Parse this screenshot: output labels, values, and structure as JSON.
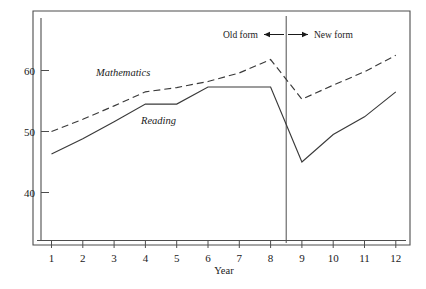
{
  "chart_data": {
    "type": "line",
    "title": "",
    "subtitle": "",
    "xlabel": "Year",
    "ylabel": "",
    "x": [
      1,
      2,
      3,
      4,
      5,
      6,
      7,
      8,
      9,
      10,
      11,
      12
    ],
    "xtick_labels": [
      "1",
      "2",
      "3",
      "4",
      "5",
      "6",
      "7",
      "8",
      "9",
      "10",
      "11",
      "12"
    ],
    "ytick_labels": [
      "40",
      "50",
      "60"
    ],
    "ytick_values": [
      40,
      50,
      60
    ],
    "xlim": [
      0.55,
      12.6
    ],
    "ylim": [
      33.5,
      65.5
    ],
    "grid": false,
    "legend_position": "inline-labels",
    "series": [
      {
        "name": "Mathematics",
        "style": "dashed",
        "label_text": "Mathematics",
        "values": [
          50.0,
          52.0,
          54.2,
          56.5,
          57.2,
          58.2,
          59.6,
          61.8,
          55.3,
          57.6,
          59.8,
          62.5
        ]
      },
      {
        "name": "Reading",
        "style": "solid",
        "label_text": "Reading",
        "values": [
          46.3,
          48.8,
          51.6,
          54.5,
          54.5,
          57.3,
          57.3,
          57.3,
          45.0,
          49.5,
          52.4,
          56.5
        ]
      }
    ],
    "annotations": [
      {
        "id": "divider",
        "type": "vertical-line",
        "x": 8.5,
        "note": "form change boundary"
      },
      {
        "id": "old-form",
        "type": "text-arrow",
        "text": "Old form",
        "direction": "left"
      },
      {
        "id": "new-form",
        "type": "text-arrow",
        "text": "New form",
        "direction": "right"
      }
    ]
  },
  "axes": {
    "x_title": "Year",
    "x_ticks": [
      "1",
      "2",
      "3",
      "4",
      "5",
      "6",
      "7",
      "8",
      "9",
      "10",
      "11",
      "12"
    ],
    "y_ticks": [
      "60",
      "50",
      "40"
    ]
  },
  "labels": {
    "mathematics": "Mathematics",
    "reading": "Reading",
    "old_form": "Old form",
    "new_form": "New form"
  },
  "colors": {
    "background": "#ffffff",
    "line": "#3a3a3a",
    "frame": "#4d4d4d",
    "text": "#1a1a1a"
  }
}
